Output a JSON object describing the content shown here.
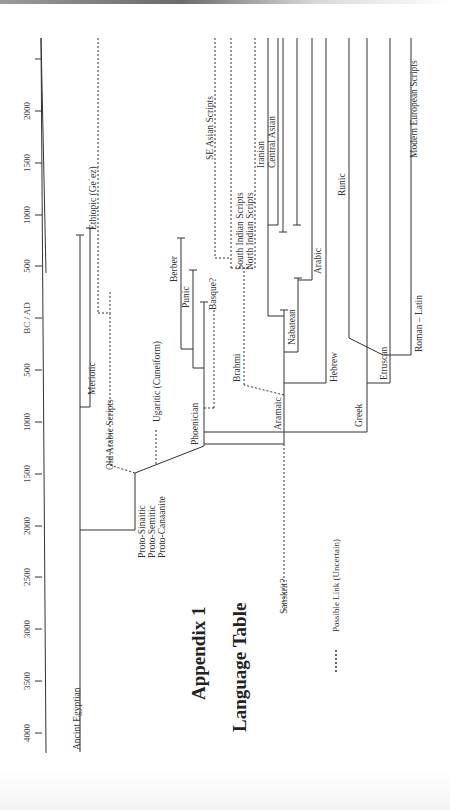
{
  "title": {
    "line1": "Appendix 1",
    "line2": "Language Table"
  },
  "legend": {
    "dashes": "-------",
    "label": "Possible Link (Uncertain)"
  },
  "axis": {
    "label": "BC / AD",
    "ticks": [
      {
        "label": "2000",
        "y": 111
      },
      {
        "label": "1500",
        "y": 163
      },
      {
        "label": "1000",
        "y": 215
      },
      {
        "label": "500",
        "y": 266
      },
      {
        "label": "BC / AD",
        "y": 318
      },
      {
        "label": "500",
        "y": 370
      },
      {
        "label": "1000",
        "y": 422
      },
      {
        "label": "1500",
        "y": 474
      },
      {
        "label": "2000",
        "y": 526
      },
      {
        "label": "2500",
        "y": 577
      },
      {
        "label": "3000",
        "y": 629
      },
      {
        "label": "3500",
        "y": 681
      },
      {
        "label": "4000",
        "y": 733
      }
    ],
    "extra_tick_y": 59
  },
  "languages": [
    {
      "name": "Ancint Egyptian",
      "x": 80,
      "y": 750
    },
    {
      "name": "Proto-Sinaitic",
      "x": 145,
      "y": 558
    },
    {
      "name": "Proto-Semitic",
      "x": 155,
      "y": 558
    },
    {
      "name": "Proto-Canaanite",
      "x": 165,
      "y": 558
    },
    {
      "name": "Meriotic",
      "x": 95,
      "y": 395
    },
    {
      "name": "Old Arabic Scripts",
      "x": 113,
      "y": 470
    },
    {
      "name": "Ugaritic (Cuneiform)",
      "x": 160,
      "y": 422
    },
    {
      "name": "Ethiopic (Ge´ez)",
      "x": 96,
      "y": 230
    },
    {
      "name": "Berber",
      "x": 177,
      "y": 282
    },
    {
      "name": "Punic",
      "x": 189,
      "y": 308
    },
    {
      "name": "Basque?",
      "x": 216,
      "y": 310
    },
    {
      "name": "Phoenician",
      "x": 198,
      "y": 445
    },
    {
      "name": "Brahmi",
      "x": 240,
      "y": 382
    },
    {
      "name": "Aramaic",
      "x": 281,
      "y": 430
    },
    {
      "name": "Sanskrit?",
      "x": 287,
      "y": 614
    },
    {
      "name": "Nabatean",
      "x": 295,
      "y": 345
    },
    {
      "name": "Arabic",
      "x": 321,
      "y": 274
    },
    {
      "name": "Hebrew",
      "x": 337,
      "y": 382
    },
    {
      "name": "Greek",
      "x": 362,
      "y": 427
    },
    {
      "name": "Etruscan",
      "x": 387,
      "y": 380
    },
    {
      "name": "Roman – Latin",
      "x": 422,
      "y": 352
    },
    {
      "name": "SE Asian Scripts",
      "x": 213,
      "y": 160
    },
    {
      "name": "South Indian Scripts",
      "x": 243,
      "y": 270
    },
    {
      "name": "North Indian Scripts",
      "x": 253,
      "y": 270
    },
    {
      "name": "Iranian",
      "x": 264,
      "y": 168
    },
    {
      "name": "Central Asian",
      "x": 275,
      "y": 168
    },
    {
      "name": "Runic",
      "x": 345,
      "y": 196
    },
    {
      "name": "Modern European Scripts",
      "x": 417,
      "y": 158
    }
  ]
}
